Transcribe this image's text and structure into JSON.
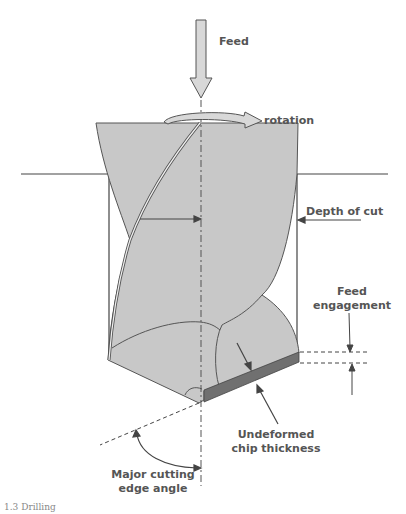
{
  "figure": {
    "title": "Drilling",
    "caption": "1.3 Drilling",
    "colors": {
      "drill_body": "#c8c8c8",
      "chip": "#707070",
      "line": "#444444",
      "arrow_fill": "#d8d8d8",
      "label": "#555555"
    },
    "labels": {
      "feed": "Feed",
      "rotation": "rotation",
      "depth_of_cut": "Depth of cut",
      "feed_engagement_line1": "Feed",
      "feed_engagement_line2": "engagement",
      "chip_thickness_line1": "Undeformed",
      "chip_thickness_line2": "chip thickness",
      "cutting_angle_line1": "Major cutting",
      "cutting_angle_line2": "edge angle"
    }
  }
}
